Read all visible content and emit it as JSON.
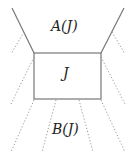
{
  "diagram": {
    "labels": {
      "top": "A(J)",
      "center": "J",
      "bottom": "B(J)"
    },
    "colors": {
      "solid_line": "#777777",
      "dotted_line": "#9a9a9a",
      "text": "#222222"
    }
  }
}
